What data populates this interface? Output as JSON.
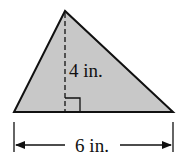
{
  "figure": {
    "shape": "triangle",
    "fill_color": "#c8c8c8",
    "stroke_color": "#111111",
    "height_label": "4 in.",
    "base_label": "6 in.",
    "right_angle_marker": true
  }
}
